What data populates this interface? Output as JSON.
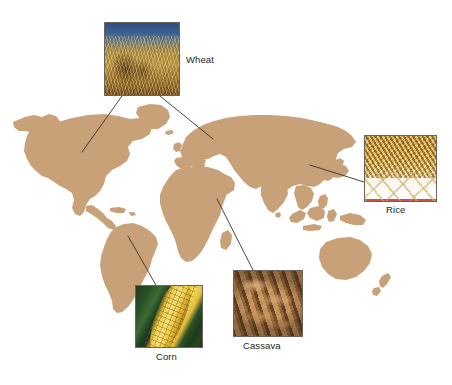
{
  "figure": {
    "background_color": "#ffffff",
    "land_color": "#c8a179",
    "leader_line_color": "#3b3226",
    "label_color": "#231f20",
    "photo_border_color": "#6e6358"
  },
  "insets": [
    {
      "id": "wheat",
      "label": "Wheat",
      "icon": "wheat-photo",
      "description": "Golden wheat heads against a blue sky",
      "label_position": "right",
      "origin_regions": [
        "North America",
        "Europe / Western Russia"
      ]
    },
    {
      "id": "rice",
      "label": "Rice",
      "icon": "rice-photo",
      "description": "Loose golden rice grains scattered on a white surface",
      "label_position": "below",
      "origin_regions": [
        "East and Southeast Asia"
      ]
    },
    {
      "id": "corn",
      "label": "Corn",
      "icon": "corn-photo",
      "description": "Yellow corn cob with green husk leaves",
      "label_position": "below",
      "origin_regions": [
        "South America"
      ]
    },
    {
      "id": "cassava",
      "label": "Cassava",
      "icon": "cassava-photo",
      "description": "Pile of brown cassava tuberous roots",
      "label_position": "below",
      "origin_regions": [
        "Central Africa"
      ]
    }
  ],
  "map": {
    "projection": "world-silhouette",
    "landmasses": [
      "North America",
      "South America",
      "Greenland",
      "Europe",
      "Africa",
      "Asia",
      "Australia",
      "New Zealand",
      "Japan",
      "Indonesia",
      "Madagascar",
      "United Kingdom",
      "Caribbean"
    ]
  }
}
